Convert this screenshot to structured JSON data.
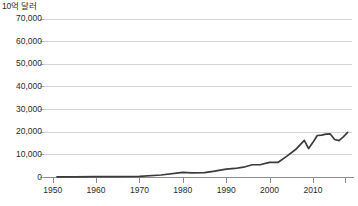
{
  "chart_data": {
    "type": "line",
    "title": "",
    "subtitle": "",
    "xlabel": "",
    "ylabel": "10억 달러",
    "unit_label": "10억 달러",
    "legend": [],
    "legend_position": "none",
    "grid": true,
    "grid_axis": "y",
    "xlim": [
      1948,
      2019
    ],
    "ylim": [
      0,
      72000
    ],
    "xticks": [
      1950,
      1960,
      1970,
      1980,
      1990,
      2000,
      2010
    ],
    "xtick_labels": [
      "1950",
      "1960",
      "1970",
      "1980",
      "1990",
      "2000",
      "2010"
    ],
    "yticks": [
      0,
      10000,
      20000,
      30000,
      40000,
      50000,
      60000,
      70000
    ],
    "ytick_labels": [
      "0",
      "10,000",
      "20,000",
      "30,000",
      "40,000",
      "50,000",
      "60,000",
      "70,000"
    ],
    "series": [
      {
        "name": "세계 상품 수출액",
        "color": "#3b3b3b",
        "x": [
          1951,
          1955,
          1960,
          1965,
          1970,
          1975,
          1980,
          1982,
          1985,
          1987,
          1990,
          1992,
          1994,
          1996,
          1998,
          2000,
          2002,
          2004,
          2006,
          2008,
          2009,
          2010,
          2011,
          2012,
          2013,
          2014,
          2015,
          2016,
          2017,
          2018
        ],
        "values": [
          83,
          95,
          130,
          190,
          317,
          877,
          2034,
          1845,
          1954,
          2511,
          3449,
          3770,
          4328,
          5403,
          5500,
          6456,
          6492,
          9218,
          12131,
          16159,
          12555,
          15302,
          18338,
          18496,
          18955,
          19017,
          16561,
          16039,
          17730,
          19670
        ],
        "annotations": [
          {
            "label": "2008 정점",
            "x": 2008,
            "y": 16159
          },
          {
            "label": "2009 금융위기 급감",
            "x": 2009,
            "y": 12555
          },
          {
            "label": "2015-2016 감소",
            "x": 2016,
            "y": 16039
          }
        ]
      }
    ],
    "y_scale_note": "세로축 눈금 단위는 10억 달러",
    "value_unit": "10억 달러"
  },
  "caption": {
    "text": ""
  }
}
